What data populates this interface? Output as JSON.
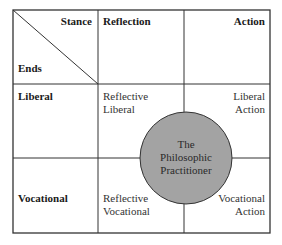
{
  "diagram": {
    "corner": {
      "column_axis": "Stance",
      "row_axis": "Ends"
    },
    "columns": [
      {
        "label": "Reflection"
      },
      {
        "label": "Action"
      }
    ],
    "rows": [
      {
        "label": "Liberal"
      },
      {
        "label": "Vocational"
      }
    ],
    "cells": {
      "liberal_reflection": {
        "line1": "Reflective",
        "line2": "Liberal"
      },
      "liberal_action": {
        "line1": "Liberal",
        "line2": "Action"
      },
      "vocational_reflection": {
        "line1": "Reflective",
        "line2": "Vocational"
      },
      "vocational_action": {
        "line1": "Vocational",
        "line2": "Action"
      }
    },
    "center_circle": {
      "line1": "The",
      "line2": "Philosophic",
      "line3": "Practitioner",
      "fill_color": "#a3a3a3"
    },
    "line_color": "#333333"
  }
}
